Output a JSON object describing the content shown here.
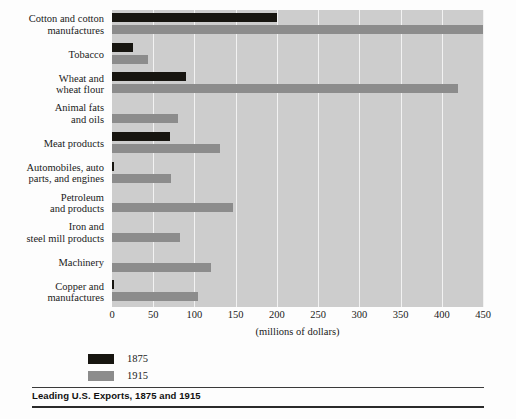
{
  "caption": "Leading U.S. Exports, 1875 and 1915",
  "legend": {
    "items": [
      {
        "label": "1875",
        "color": "#171510"
      },
      {
        "label": "1915",
        "color": "#8c8c8c"
      }
    ]
  },
  "chart_data": {
    "type": "bar",
    "orientation": "horizontal",
    "title": "Leading U.S. Exports, 1875 and 1915",
    "xlabel": "(millions of dollars)",
    "ylabel": "",
    "xlim": [
      0,
      450
    ],
    "xticks": [
      0,
      50,
      100,
      150,
      200,
      250,
      300,
      350,
      400,
      450
    ],
    "xticklabels": [
      "0",
      "50",
      "100",
      "150",
      "200",
      "250",
      "300",
      "350",
      "400",
      "450"
    ],
    "grid": true,
    "grid_axis": "x",
    "legend_position": "below-left",
    "plot_background": "#cdcdcd",
    "gridline_color": "#f2f2f2",
    "categories": [
      "Cotton and cotton manufactures",
      "Tobacco",
      "Wheat and wheat flour",
      "Animal fats and oils",
      "Meat products",
      "Automobiles, auto parts, and engines",
      "Petroleum and products",
      "Iron and steel mill products",
      "Machinery",
      "Copper and manufactures"
    ],
    "category_lines": [
      [
        "Cotton and cotton",
        "manufactures"
      ],
      [
        "Tobacco"
      ],
      [
        "Wheat and",
        "wheat flour"
      ],
      [
        "Animal fats",
        "and oils"
      ],
      [
        "Meat products"
      ],
      [
        "Automobiles, auto",
        "parts, and engines"
      ],
      [
        "Petroleum",
        "and products"
      ],
      [
        "Iron and",
        "steel mill products"
      ],
      [
        "Machinery"
      ],
      [
        "Copper and",
        "manufactures"
      ]
    ],
    "series": [
      {
        "name": "1875",
        "color": "#171510",
        "values": [
          200,
          25,
          90,
          0,
          70,
          3,
          0,
          0,
          0,
          3
        ]
      },
      {
        "name": "1915",
        "color": "#8c8c8c",
        "values": [
          450,
          44,
          420,
          80,
          131,
          71,
          147,
          82,
          120,
          104
        ]
      }
    ]
  }
}
